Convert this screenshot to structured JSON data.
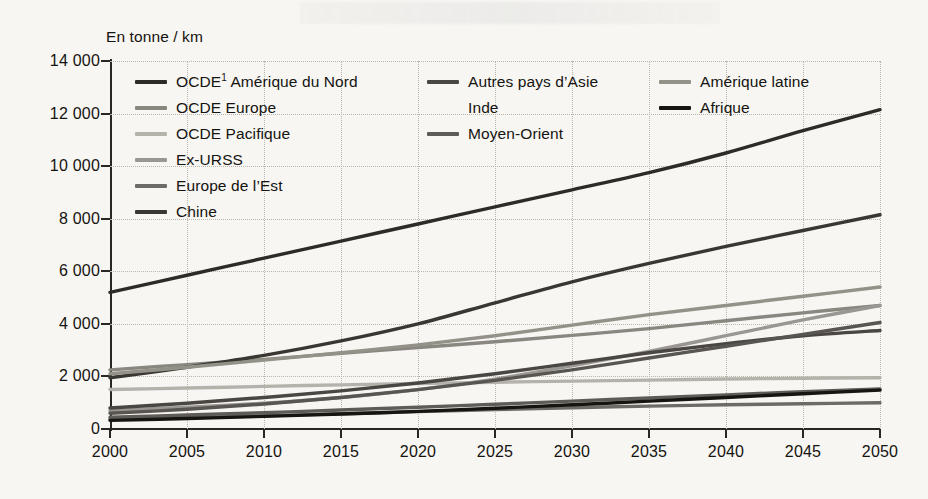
{
  "axis": {
    "y_unit_label": "En tonne / km",
    "y_ticks": [
      "14 000",
      "12 000",
      "10 000",
      "8 000",
      "6 000",
      "4 000",
      "2 000",
      "0"
    ],
    "x_ticks": [
      "2000",
      "2005",
      "2010",
      "2015",
      "2020",
      "2025",
      "2030",
      "2035",
      "2040",
      "2045",
      "2050"
    ]
  },
  "legend": {
    "col1": [
      {
        "label": "OCDE",
        "sup": "1",
        "label2": " Amérique du Nord",
        "color": "#2e2b27"
      },
      {
        "label": "OCDE Europe",
        "color": "#8a8781"
      },
      {
        "label": "OCDE Pacifique",
        "color": "#b5b2ac"
      },
      {
        "label": "Ex-URSS",
        "color": "#9a9792"
      },
      {
        "label": "Europe de l’Est",
        "color": "#6e6b66"
      },
      {
        "label": "Chine",
        "color": "#3a3733"
      }
    ],
    "col2": [
      {
        "label": "Autres pays d’Asie",
        "color": "#4a4743"
      },
      {
        "label": "Inde",
        "color": "#59565१"
      },
      {
        "label": "Moyen-Orient",
        "color": "#5f5c57"
      }
    ],
    "col3": [
      {
        "label": "Amérique latine",
        "color": "#949189"
      },
      {
        "label": "Afrique",
        "color": "#17150f"
      }
    ]
  },
  "chart_data": {
    "type": "line",
    "title": "",
    "xlabel": "",
    "ylabel": "En tonne / km",
    "xlim": [
      2000,
      2050
    ],
    "ylim": [
      0,
      14000
    ],
    "grid": true,
    "legend_position": "inside-top-left",
    "x": [
      2000,
      2005,
      2010,
      2015,
      2020,
      2025,
      2030,
      2035,
      2040,
      2045,
      2050
    ],
    "series": [
      {
        "name": "OCDE1 Amérique du Nord",
        "color": "#2e2b27",
        "values": [
          5200,
          5850,
          6500,
          7150,
          7800,
          8450,
          9100,
          9750,
          10500,
          11350,
          12150
        ]
      },
      {
        "name": "OCDE Europe",
        "color": "#8a8781",
        "values": [
          2250,
          2450,
          2650,
          2880,
          3100,
          3320,
          3560,
          3820,
          4120,
          4420,
          4700
        ]
      },
      {
        "name": "OCDE Pacifique",
        "color": "#b5b2ac",
        "values": [
          1500,
          1560,
          1620,
          1680,
          1730,
          1780,
          1820,
          1860,
          1900,
          1930,
          1950
        ]
      },
      {
        "name": "Ex-URSS",
        "color": "#9a9792",
        "values": [
          700,
          830,
          980,
          1200,
          1500,
          1900,
          2400,
          2950,
          3550,
          4150,
          4700
        ]
      },
      {
        "name": "Europe de l’Est",
        "color": "#6e6b66",
        "values": [
          380,
          430,
          500,
          580,
          660,
          740,
          810,
          870,
          920,
          960,
          1000
        ]
      },
      {
        "name": "Chine",
        "color": "#3a3733",
        "values": [
          1950,
          2350,
          2800,
          3350,
          4000,
          4800,
          5600,
          6300,
          6950,
          7550,
          8150
        ]
      },
      {
        "name": "Autres pays d’Asie",
        "color": "#4a4743",
        "values": [
          800,
          980,
          1200,
          1450,
          1750,
          2100,
          2500,
          2900,
          3250,
          3550,
          3750
        ]
      },
      {
        "name": "Inde",
        "color": "#595651",
        "values": [
          600,
          750,
          950,
          1200,
          1500,
          1850,
          2250,
          2700,
          3150,
          3600,
          4050
        ]
      },
      {
        "name": "Moyen-Orient",
        "color": "#5f5c57",
        "values": [
          450,
          530,
          620,
          720,
          830,
          940,
          1060,
          1180,
          1300,
          1420,
          1520
        ]
      },
      {
        "name": "Amérique latine",
        "color": "#949189",
        "values": [
          2100,
          2350,
          2620,
          2900,
          3200,
          3550,
          3950,
          4350,
          4700,
          5050,
          5400
        ]
      },
      {
        "name": "Afrique",
        "color": "#17150f",
        "values": [
          330,
          400,
          480,
          570,
          670,
          790,
          920,
          1060,
          1200,
          1340,
          1480
        ]
      }
    ]
  }
}
